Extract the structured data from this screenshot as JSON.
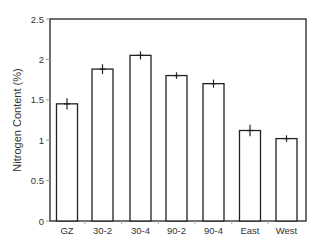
{
  "chart_data": {
    "type": "bar",
    "title": "",
    "xlabel": "",
    "ylabel": "Nitrogen Content (%)",
    "categories": [
      "GZ",
      "30-2",
      "30-4",
      "90-2",
      "90-4",
      "East",
      "West"
    ],
    "values": [
      1.45,
      1.88,
      2.05,
      1.8,
      1.7,
      1.12,
      1.02
    ],
    "error": [
      0.07,
      0.06,
      0.05,
      0.04,
      0.05,
      0.07,
      0.04
    ],
    "ylim": [
      0,
      2.5
    ],
    "yticks": [
      0,
      0.5,
      1,
      1.5,
      2,
      2.5
    ],
    "ytick_labels": [
      "0",
      "0.5",
      "1",
      "1.5",
      "2",
      "2.5"
    ],
    "grid": false,
    "legend": null,
    "bar_fill": "#ffffff",
    "bar_stroke": "#222222"
  }
}
